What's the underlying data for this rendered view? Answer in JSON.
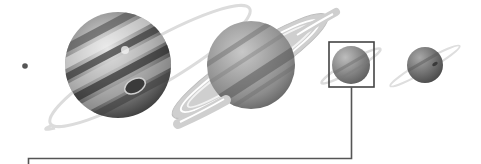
{
  "diagram": {
    "background": "#ffffff",
    "moon": {
      "name": "moon-dot",
      "cx": 25,
      "cy": 66,
      "r": 3,
      "color": "#555555"
    },
    "planets": [
      {
        "name": "jupiter",
        "cx": 118,
        "cy": 65,
        "r": 53,
        "ring": true
      },
      {
        "name": "saturn",
        "cx": 251,
        "cy": 65,
        "r": 44,
        "ring": true
      },
      {
        "name": "uranus",
        "cx": 351,
        "cy": 65,
        "r": 19,
        "ring": true,
        "highlighted": true
      },
      {
        "name": "neptune",
        "cx": 425,
        "cy": 65,
        "r": 18,
        "ring": true
      }
    ],
    "callout": {
      "box": {
        "x": 329,
        "y": 42,
        "width": 45,
        "height": 45,
        "stroke": "#444444"
      },
      "connector_color": "#555555"
    }
  }
}
